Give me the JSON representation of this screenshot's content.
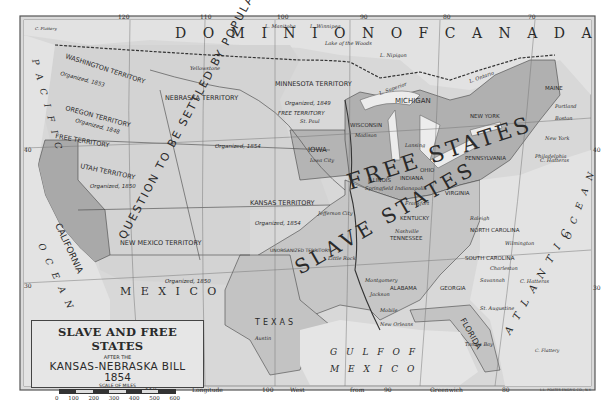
{
  "map": {
    "title": "SLAVE AND FREE STATES",
    "subtitle_small": "AFTER THE",
    "subtitle": "KANSAS-NEBRASKA BILL",
    "year": "1854",
    "scale_label": "SCALE OF MILES",
    "scale_ticks": [
      "0",
      "100",
      "200",
      "300",
      "400",
      "500",
      "600"
    ],
    "publisher": "L.L. POATES ENGR'G CO., N.Y.",
    "colors": {
      "background": "#d6d6d6",
      "free_states": "#b3b3b3",
      "slave_states": "#c9c9c9",
      "water": "#e4e4e4",
      "border": "#4a4a4a",
      "text": "#2a2a2a"
    },
    "longitude_top": [
      "120",
      "110",
      "100",
      "90",
      "80",
      "70"
    ],
    "longitude_bottom": [
      "110",
      "Longitude",
      "100",
      "West",
      "from",
      "90",
      "Greenwich",
      "80"
    ],
    "latitude": [
      "40",
      "30"
    ],
    "regions": {
      "dominion": "D O M I N I O N   O F   C A N A D A",
      "free_states": "FREE STATES",
      "slave_states": "SLAVE STATES",
      "popular_sovereignty": "QUESTION TO BE SETTLED BY POPULAR SOVEREIGNTY",
      "slavery_word": "SLAVERY",
      "gulf": "G U L F   O F",
      "mexico_gulf": "M E X I C O",
      "mexico": "M E X I C O",
      "pacific": "P A C I F I C",
      "ocean_west": "O C E A N",
      "atlantic": "A T L A N T I C",
      "ocean_east": "O C E A N"
    },
    "territories": [
      {
        "name": "WASHINGTON TERRITORY",
        "note": "Organized, 1853",
        "sub": "FREE TERRITORY"
      },
      {
        "name": "OREGON TERRITORY",
        "note": "Organized, 1848",
        "sub": "FREE TERRITORY"
      },
      {
        "name": "UTAH TERRITORY",
        "note": "Organized, 1850"
      },
      {
        "name": "NEBRASKA TERRITORY",
        "note": "Organized, 1854"
      },
      {
        "name": "MINNESOTA TERRITORY",
        "note": "Organized, 1849",
        "sub": "FREE TERRITORY"
      },
      {
        "name": "KANSAS TERRITORY",
        "note": "Organized, 1854"
      },
      {
        "name": "NEW MEXICO TERRITORY",
        "note": "Organized, 1850"
      },
      {
        "name": "UNORGANIZED TERRITORY"
      }
    ],
    "states": [
      "CALIFORNIA",
      "IOWA",
      "WISCONSIN",
      "MICHIGAN",
      "ILLINOIS",
      "INDIANA",
      "OHIO",
      "NEW YORK",
      "PENNSYLVANIA",
      "MAINE",
      "VIRGINIA",
      "KENTUCKY",
      "TENNESSEE",
      "NORTH CAROLINA",
      "SOUTH CAROLINA",
      "GEORGIA",
      "ALABAMA",
      "FLORIDA",
      "TEXAS",
      "MISSOURI",
      "ARKANSAS",
      "MISSISSIPPI",
      "LOUISIANA"
    ],
    "cities": [
      "Olympia",
      "Salem",
      "Sacramento",
      "San Francisco Bay",
      "Great Salt Lake",
      "St. Paul",
      "Madison",
      "Lansing",
      "Iowa City",
      "Springfield",
      "Indianapolis",
      "Columbus",
      "Jefferson City",
      "Frankfort",
      "Nashville",
      "Little Rock",
      "Jackson",
      "Montgomery",
      "Milledgeville",
      "Mobile",
      "New Orleans",
      "Tallahassee",
      "Austin",
      "Raleigh",
      "Wilmington",
      "Charleston",
      "Savannah",
      "St. Augustine",
      "Albany",
      "Boston",
      "Portland",
      "Augusta",
      "New York",
      "Philadelphia",
      "Harrisburg",
      "Richmond"
    ],
    "features": [
      "L. Winnipeg",
      "L. Manitoba",
      "Lake of the Woods",
      "L. Nipigon",
      "L. Superior",
      "L. Michigan",
      "L. Huron",
      "L. Erie",
      "L. Ontario",
      "Ottawa R.",
      "St. Lawrence R.",
      "Missouri",
      "Yellowstone",
      "Snake",
      "Platte R.",
      "Arkansas R.",
      "Red R.",
      "Mississippi",
      "Rio Grande",
      "Columbia R.",
      "C. Hatteras",
      "C. Charles",
      "C. Henry",
      "C. May",
      "C. Henlopen",
      "C. Cod",
      "C. Canaveral",
      "C. Sable",
      "Tampa Bay",
      "Straits of Florida",
      "BAHAMA ISLANDS",
      "C. Flattery"
    ]
  }
}
